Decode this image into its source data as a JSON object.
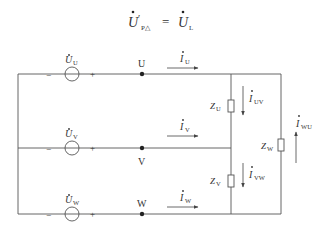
{
  "equation": {
    "lhs_symbol": "U",
    "lhs_prime": "′",
    "lhs_subscript": "P△",
    "equals": "=",
    "rhs_symbol": "U",
    "rhs_subscript": "L"
  },
  "sources": [
    {
      "symbol": "U",
      "subscript": "U",
      "minus": "−",
      "plus": "+"
    },
    {
      "symbol": "U",
      "subscript": "V",
      "minus": "−",
      "plus": "+"
    },
    {
      "symbol": "U",
      "subscript": "W",
      "minus": "−",
      "plus": "+"
    }
  ],
  "nodes": [
    {
      "label": "U"
    },
    {
      "label": "V"
    },
    {
      "label": "W"
    }
  ],
  "line_currents": [
    {
      "symbol": "I",
      "subscript": "U"
    },
    {
      "symbol": "I",
      "subscript": "V"
    },
    {
      "symbol": "I",
      "subscript": "W"
    }
  ],
  "impedances": [
    {
      "symbol": "Z",
      "subscript": "U"
    },
    {
      "symbol": "Z",
      "subscript": "V"
    },
    {
      "symbol": "Z",
      "subscript": "W"
    }
  ],
  "phase_currents": [
    {
      "symbol": "I",
      "subscript": "UV"
    },
    {
      "symbol": "I",
      "subscript": "VW"
    },
    {
      "symbol": "I",
      "subscript": "WU"
    }
  ],
  "colors": {
    "wire": "#555555",
    "text": "#333333"
  }
}
